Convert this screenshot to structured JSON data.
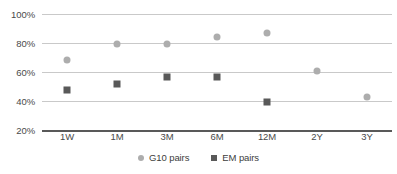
{
  "chart_data": {
    "type": "scatter",
    "title": "",
    "subtitle": "",
    "xlabel": "",
    "ylabel": "",
    "categories": [
      "1W",
      "1M",
      "3M",
      "6M",
      "12M",
      "2Y",
      "3Y"
    ],
    "ytick_labels": [
      "100%",
      "80%",
      "60%",
      "40%",
      "20%"
    ],
    "ytick_values": [
      100,
      80,
      60,
      40,
      20
    ],
    "ylim": [
      20,
      100
    ],
    "grid": true,
    "legend_position": "bottom-center",
    "series": [
      {
        "name": "G10 pairs",
        "marker": "circle",
        "color": "#adadad",
        "values": [
          68,
          79.5,
          79.5,
          84,
          87,
          60.5,
          42.5
        ]
      },
      {
        "name": "EM pairs",
        "marker": "square",
        "color": "#595959",
        "values": [
          47.5,
          52,
          56.5,
          56.5,
          39,
          null,
          null
        ]
      }
    ]
  },
  "legend": {
    "items": [
      {
        "label": "G10 pairs",
        "marker": "circle-marker-icon"
      },
      {
        "label": "EM pairs",
        "marker": "square-marker-icon"
      }
    ]
  },
  "colors": {
    "g10": "#adadad",
    "em": "#595959",
    "gridline": "#c9c9c9",
    "axis": "#595959",
    "text": "#4a4a4a"
  }
}
